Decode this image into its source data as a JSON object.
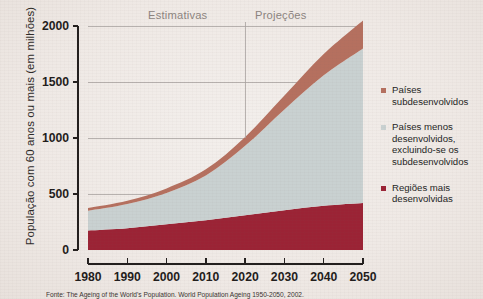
{
  "axes": {
    "ylabel": "População com 60 anos ou mais (em milhões)",
    "yticks": [
      "0",
      "500",
      "1000",
      "1500",
      "2000"
    ],
    "xticks": [
      "1980",
      "1990",
      "2000",
      "2010",
      "2020",
      "2030",
      "2040",
      "2050"
    ]
  },
  "annotations": {
    "estimates_label": "Estimativas",
    "projections_label": "Projeções"
  },
  "legend": {
    "items": [
      {
        "label": "Países subdesenvolvidos",
        "color": "#b5705f"
      },
      {
        "label": "Países menos desenvolvidos, excluindo-se os subdesenvolvidos",
        "color": "#c9d1d1"
      },
      {
        "label": "Regiões mais desenvolvidas",
        "color": "#9b2335"
      }
    ]
  },
  "source": "Fonte: The Ageing of the World's Population. World Population Ageing 1950-2050, 2002.",
  "chart_data": {
    "type": "area",
    "title": "",
    "xlabel": "",
    "ylabel": "População com 60 anos ou mais (em milhões)",
    "x": [
      1980,
      1990,
      2000,
      2010,
      2020,
      2030,
      2040,
      2050
    ],
    "xlim": [
      1980,
      2050
    ],
    "ylim": [
      0,
      2000
    ],
    "yticks": [
      0,
      500,
      1000,
      1500,
      2000
    ],
    "grid": true,
    "stacked": true,
    "legend_position": "right",
    "divider_x": 2020,
    "divider_note": "Vertical line separating estimates (left) from projections (right)",
    "series": [
      {
        "name": "Regiões mais desenvolvidas",
        "color": "#9b2335",
        "values": [
          175,
          195,
          230,
          265,
          310,
          355,
          395,
          420
        ]
      },
      {
        "name": "Países menos desenvolvidos, excluindo-se os subdesenvolvidos",
        "color": "#c9d1d1",
        "values": [
          175,
          215,
          280,
          400,
          620,
          900,
          1165,
          1380
        ]
      },
      {
        "name": "Países subdesenvolvidos",
        "color": "#b5705f",
        "values": [
          25,
          30,
          40,
          55,
          80,
          125,
          190,
          250
        ]
      }
    ],
    "totals": [
      375,
      440,
      550,
      720,
      1010,
      1380,
      1750,
      2050
    ]
  }
}
